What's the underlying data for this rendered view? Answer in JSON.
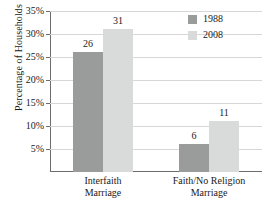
{
  "chart_data": {
    "type": "bar",
    "title": "",
    "xlabel": "",
    "ylabel": "Percentage of Households",
    "categories": [
      "Interfaith\nMarriage",
      "Faith/No Religion\nMarriage"
    ],
    "category_lines": [
      [
        "Interfaith",
        "Marriage"
      ],
      [
        "Faith/No Religion",
        "Marriage"
      ]
    ],
    "series": [
      {
        "name": "1988",
        "values": [
          26,
          6
        ],
        "color": "#9a9b9b"
      },
      {
        "name": "2008",
        "values": [
          31,
          11
        ],
        "color": "#d9dada"
      }
    ],
    "ylim": [
      0,
      35
    ],
    "yticks": [
      5,
      10,
      15,
      20,
      25,
      30,
      35
    ],
    "ytick_labels": [
      "5%",
      "10%",
      "15%",
      "20%",
      "25%",
      "30%",
      "35%"
    ],
    "data_labels": [
      "26",
      "31",
      "6",
      "11"
    ],
    "grid": true,
    "legend_position": "top-right",
    "axis_color": "#6d6d6d",
    "grid_color": "#d7d7d7",
    "background": "#ffffff"
  }
}
